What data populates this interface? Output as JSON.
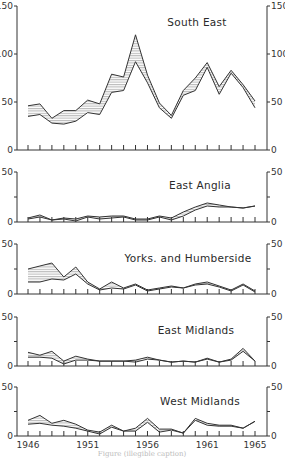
{
  "figure": {
    "caption": "Figure (illegible caption)",
    "x_tick_labels": [
      "1946",
      "1951",
      "1956",
      "1961",
      "1965"
    ]
  },
  "chart_data": [
    {
      "type": "area",
      "title": "South East",
      "xlabel": "",
      "ylabel": "",
      "ylim": [
        0,
        150
      ],
      "yticks": [
        0,
        50,
        100,
        150
      ],
      "grid": false,
      "x": [
        1946,
        1947,
        1948,
        1949,
        1950,
        1951,
        1952,
        1953,
        1954,
        1955,
        1956,
        1957,
        1958,
        1959,
        1960,
        1961,
        1962,
        1963,
        1964,
        1965
      ],
      "series": [
        {
          "name": "upper",
          "values": [
            46,
            48,
            33,
            41,
            41,
            52,
            48,
            79,
            76,
            120,
            78,
            49,
            36,
            62,
            75,
            91,
            66,
            83,
            68,
            51
          ]
        },
        {
          "name": "lower",
          "values": [
            35,
            37,
            28,
            27,
            30,
            39,
            37,
            60,
            62,
            92,
            70,
            44,
            33,
            57,
            62,
            86,
            58,
            80,
            65,
            44
          ]
        }
      ],
      "note": "Hatched band between upper and lower series"
    },
    {
      "type": "area",
      "title": "East Anglia",
      "ylim": [
        0,
        50
      ],
      "yticks": [
        0,
        25,
        50
      ],
      "x": [
        1946,
        1947,
        1948,
        1949,
        1950,
        1951,
        1952,
        1953,
        1954,
        1955,
        1956,
        1957,
        1958,
        1959,
        1960,
        1961,
        1962,
        1963,
        1964,
        1965
      ],
      "series": [
        {
          "name": "upper",
          "values": [
            4,
            7,
            2,
            4,
            3,
            6,
            5,
            6,
            6,
            3,
            3,
            6,
            4,
            10,
            15,
            19,
            17,
            15,
            14,
            16
          ]
        },
        {
          "name": "lower",
          "values": [
            3,
            5,
            2,
            3,
            1,
            5,
            3,
            4,
            5,
            2,
            2,
            5,
            2,
            6,
            12,
            16,
            15,
            15,
            14,
            16
          ]
        }
      ]
    },
    {
      "type": "area",
      "title": "Yorks. and Humberside",
      "ylim": [
        0,
        50
      ],
      "yticks": [
        0,
        25,
        50
      ],
      "x": [
        1946,
        1947,
        1948,
        1949,
        1950,
        1951,
        1952,
        1953,
        1954,
        1955,
        1956,
        1957,
        1958,
        1959,
        1960,
        1961,
        1962,
        1963,
        1964,
        1965
      ],
      "series": [
        {
          "name": "upper",
          "values": [
            25,
            28,
            31,
            17,
            27,
            12,
            5,
            12,
            6,
            10,
            4,
            6,
            8,
            6,
            10,
            12,
            8,
            4,
            10,
            3
          ]
        },
        {
          "name": "lower",
          "values": [
            12,
            12,
            15,
            14,
            20,
            10,
            4,
            6,
            5,
            9,
            3,
            5,
            7,
            6,
            9,
            10,
            7,
            3,
            9,
            2
          ]
        }
      ]
    },
    {
      "type": "area",
      "title": "East Midlands",
      "ylim": [
        0,
        50
      ],
      "yticks": [
        0,
        25,
        50
      ],
      "x": [
        1946,
        1947,
        1948,
        1949,
        1950,
        1951,
        1952,
        1953,
        1954,
        1955,
        1956,
        1957,
        1958,
        1959,
        1960,
        1961,
        1962,
        1963,
        1964,
        1965
      ],
      "series": [
        {
          "name": "upper",
          "values": [
            14,
            11,
            15,
            5,
            10,
            7,
            5,
            5,
            5,
            6,
            9,
            6,
            4,
            5,
            4,
            8,
            4,
            7,
            18,
            5
          ]
        },
        {
          "name": "lower",
          "values": [
            9,
            9,
            8,
            2,
            6,
            6,
            5,
            5,
            5,
            4,
            7,
            6,
            4,
            5,
            4,
            7,
            4,
            6,
            15,
            5
          ]
        }
      ]
    },
    {
      "type": "area",
      "title": "West Midlands",
      "ylim": [
        0,
        50
      ],
      "yticks": [
        0,
        25,
        50
      ],
      "x": [
        1946,
        1947,
        1948,
        1949,
        1950,
        1951,
        1952,
        1953,
        1954,
        1955,
        1956,
        1957,
        1958,
        1959,
        1960,
        1961,
        1962,
        1963,
        1964,
        1965
      ],
      "series": [
        {
          "name": "upper",
          "values": [
            16,
            21,
            13,
            16,
            12,
            6,
            4,
            11,
            5,
            8,
            18,
            7,
            7,
            3,
            18,
            13,
            11,
            11,
            8,
            15
          ]
        },
        {
          "name": "lower",
          "values": [
            12,
            13,
            11,
            10,
            8,
            5,
            2,
            9,
            5,
            5,
            14,
            4,
            6,
            3,
            16,
            11,
            10,
            10,
            8,
            15
          ]
        }
      ]
    }
  ]
}
